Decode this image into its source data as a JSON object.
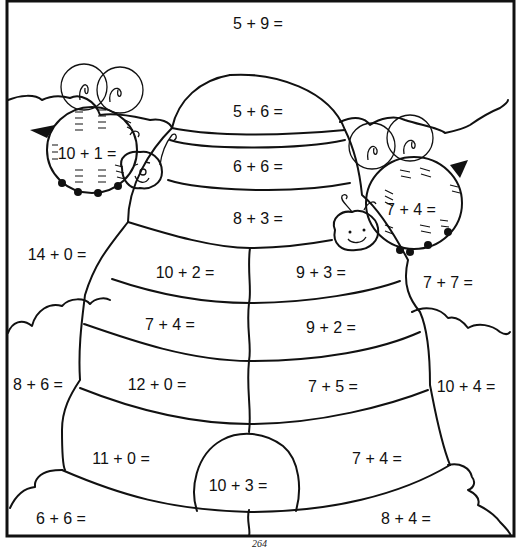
{
  "worksheet": {
    "page_number": "264",
    "equations": [
      {
        "id": "top-sky",
        "text": "5 + 9 =",
        "x": 258,
        "y": 24
      },
      {
        "id": "hive-dome",
        "text": "5 + 6 =",
        "x": 258,
        "y": 112
      },
      {
        "id": "hive-band-1",
        "text": "6 + 6 =",
        "x": 258,
        "y": 167
      },
      {
        "id": "hive-band-2",
        "text": "8 + 3 =",
        "x": 258,
        "y": 219
      },
      {
        "id": "left-bee",
        "text": "10 + 1 =",
        "x": 87,
        "y": 154
      },
      {
        "id": "right-bee",
        "text": "7 + 4 =",
        "x": 411,
        "y": 210
      },
      {
        "id": "left-sky",
        "text": "14 + 0 =",
        "x": 57,
        "y": 255
      },
      {
        "id": "hive-band-3-left",
        "text": "10 + 2 =",
        "x": 185,
        "y": 273
      },
      {
        "id": "hive-band-3-right",
        "text": "9 + 3 =",
        "x": 321,
        "y": 273
      },
      {
        "id": "right-sky",
        "text": "7 + 7 =",
        "x": 448,
        "y": 283
      },
      {
        "id": "hive-band-4-left",
        "text": "7 + 4 =",
        "x": 170,
        "y": 325
      },
      {
        "id": "hive-band-4-right",
        "text": "9 + 2 =",
        "x": 331,
        "y": 328
      },
      {
        "id": "left-cloud",
        "text": "8 + 6 =",
        "x": 38,
        "y": 385
      },
      {
        "id": "hive-band-5-left",
        "text": "12 + 0 =",
        "x": 157,
        "y": 385
      },
      {
        "id": "hive-band-5-right",
        "text": "7 + 5 =",
        "x": 333,
        "y": 387
      },
      {
        "id": "right-cloud",
        "text": "10 + 4 =",
        "x": 466,
        "y": 387
      },
      {
        "id": "hive-bottom-left",
        "text": "11 + 0 =",
        "x": 121,
        "y": 459
      },
      {
        "id": "hive-door",
        "text": "10 + 3 =",
        "x": 238,
        "y": 486
      },
      {
        "id": "hive-bottom-right",
        "text": "7 + 4 =",
        "x": 377,
        "y": 459
      },
      {
        "id": "bottom-left-ground",
        "text": "6 + 6 =",
        "x": 61,
        "y": 519
      },
      {
        "id": "bottom-right-ground",
        "text": "8 + 4 =",
        "x": 406,
        "y": 519
      }
    ]
  }
}
